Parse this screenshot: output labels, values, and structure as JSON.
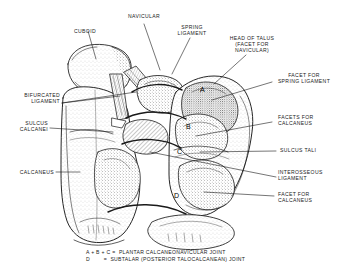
{
  "figure": {
    "line_color": "#1a1a1a",
    "background": "#ffffff"
  },
  "labels": {
    "cuboid": "CUBOID",
    "navicular": "NAVICULAR",
    "spring_ligament": "SPRING\nLIGAMENT",
    "head_of_talus": "HEAD OF TALUS\n(FACET FOR\nNAVICULAR)",
    "facet_for_spring_ligament": "FACET FOR\nSPRING LIGAMENT",
    "facets_for_calcaneus": "FACETS FOR\nCALCANEUS",
    "sulcus_tali": "SULCUS TALI",
    "interosseous_ligament": "INTEROSSEOUS\nLIGAMENT",
    "facet_for_calcaneus": "FACET FOR\nCALCANEUS",
    "bifurcated_ligament": "BIFURCATED\nLIGAMENT",
    "sulcus_calcanei": "SULCUS\nCALCANEI",
    "calcaneus": "CALCANEUS"
  },
  "markers": {
    "a": "A",
    "b": "B",
    "c": "C",
    "d": "D"
  },
  "legend": {
    "line1": "A + B + C =  PLANTAR CALCANEONAVICULAR JOINT",
    "line2": "D        =  SUBTALAR (POSTERIOR TALOCALCANEAN) JOINT"
  }
}
